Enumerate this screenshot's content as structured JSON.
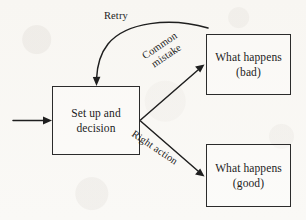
{
  "diagram": {
    "background_color": "#faf8f5",
    "stroke_color": "#1f1f1f",
    "nodes": [
      {
        "id": "decision",
        "label": "Set up and\ndecision",
        "name": "node-set-up-and-decision"
      },
      {
        "id": "bad",
        "label": "What happens\n(bad)",
        "name": "node-what-happens-bad"
      },
      {
        "id": "good",
        "label": "What happens\n(good)",
        "name": "node-what-happens-good"
      }
    ],
    "edges": [
      {
        "id": "input",
        "label": "",
        "from": "",
        "to": "decision",
        "style": "straight-arrow"
      },
      {
        "id": "common-mistake",
        "label": "Common\nmistake",
        "from": "decision",
        "to": "bad",
        "style": "straight-arrow"
      },
      {
        "id": "right-action",
        "label": "Right action",
        "from": "decision",
        "to": "good",
        "style": "straight-arrow"
      },
      {
        "id": "retry",
        "label": "Retry",
        "from": "bad",
        "to": "decision",
        "style": "curved-arrow"
      }
    ]
  }
}
